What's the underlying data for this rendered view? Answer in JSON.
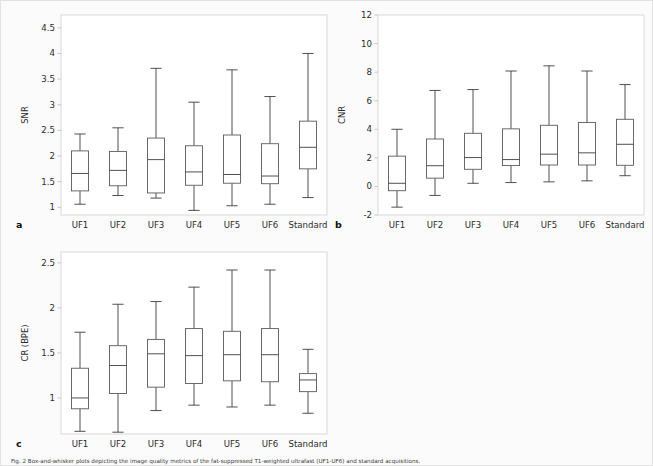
{
  "figure": {
    "background": "#fbfbfb",
    "caption": "Fig. 2  Box-and-whisker plots depicting the image quality metrics of the fat-suppressed T1-weighted ultrafast (UF1-UF6) and standard acquisitions."
  },
  "chart_data": [
    {
      "type": "box",
      "panel_letter": "a",
      "title": "",
      "xlabel": "",
      "ylabel": "SNR",
      "categories": [
        "UF1",
        "UF2",
        "UF3",
        "UF4",
        "UF5",
        "UF6",
        "Standard"
      ],
      "yticks": [
        1,
        1.5,
        2,
        2.5,
        3,
        3.5,
        4,
        4.5
      ],
      "ytick_labels": [
        "1",
        "1.5",
        "2",
        "2.5",
        "3",
        "3.5",
        "4",
        "4.5"
      ],
      "ylim": [
        0.85,
        4.75
      ],
      "grid": false,
      "legend": "none",
      "boxes": [
        {
          "category": "UF1",
          "min": 1.06,
          "q1": 1.32,
          "median": 1.66,
          "q3": 2.1,
          "max": 2.43
        },
        {
          "category": "UF2",
          "min": 1.23,
          "q1": 1.42,
          "median": 1.72,
          "q3": 2.09,
          "max": 2.55
        },
        {
          "category": "UF3",
          "min": 1.18,
          "q1": 1.28,
          "median": 1.93,
          "q3": 2.35,
          "max": 3.71
        },
        {
          "category": "UF4",
          "min": 0.94,
          "q1": 1.43,
          "median": 1.69,
          "q3": 2.2,
          "max": 3.05
        },
        {
          "category": "UF5",
          "min": 1.03,
          "q1": 1.47,
          "median": 1.64,
          "q3": 2.41,
          "max": 3.68
        },
        {
          "category": "UF6",
          "min": 1.06,
          "q1": 1.46,
          "median": 1.61,
          "q3": 2.24,
          "max": 3.16
        },
        {
          "category": "Standard",
          "min": 1.19,
          "q1": 1.75,
          "median": 2.17,
          "q3": 2.68,
          "max": 4.0
        }
      ]
    },
    {
      "type": "box",
      "panel_letter": "b",
      "title": "",
      "xlabel": "",
      "ylabel": "CNR",
      "categories": [
        "UF1",
        "UF2",
        "UF3",
        "UF4",
        "UF5",
        "UF6",
        "Standard"
      ],
      "yticks": [
        -2,
        0,
        2,
        4,
        6,
        8,
        10,
        12
      ],
      "ytick_labels": [
        "-2",
        "0",
        "2",
        "4",
        "6",
        "8",
        "10",
        "12"
      ],
      "ylim": [
        -2,
        12
      ],
      "grid": false,
      "legend": "none",
      "boxes": [
        {
          "category": "UF1",
          "min": -1.45,
          "q1": -0.3,
          "median": 0.22,
          "q3": 2.12,
          "max": 4.0
        },
        {
          "category": "UF2",
          "min": -0.63,
          "q1": 0.58,
          "median": 1.45,
          "q3": 3.32,
          "max": 6.72
        },
        {
          "category": "UF3",
          "min": 0.22,
          "q1": 1.2,
          "median": 2.02,
          "q3": 3.72,
          "max": 6.78
        },
        {
          "category": "UF4",
          "min": 0.27,
          "q1": 1.46,
          "median": 1.88,
          "q3": 4.03,
          "max": 8.08
        },
        {
          "category": "UF5",
          "min": 0.32,
          "q1": 1.5,
          "median": 2.26,
          "q3": 4.28,
          "max": 8.44
        },
        {
          "category": "UF6",
          "min": 0.39,
          "q1": 1.5,
          "median": 2.35,
          "q3": 4.48,
          "max": 8.08
        },
        {
          "category": "Standard",
          "min": 0.75,
          "q1": 1.48,
          "median": 2.95,
          "q3": 4.7,
          "max": 7.13
        }
      ]
    },
    {
      "type": "box",
      "panel_letter": "c",
      "title": "",
      "xlabel": "",
      "ylabel": "CR (BPE)",
      "categories": [
        "UF1",
        "UF2",
        "UF3",
        "UF4",
        "UF5",
        "UF6",
        "Standard"
      ],
      "yticks": [
        1,
        1.5,
        2,
        2.5
      ],
      "ytick_labels": [
        "1",
        "1.5",
        "2",
        "2.5"
      ],
      "ylim": [
        0.6,
        2.62
      ],
      "grid": false,
      "legend": "none",
      "boxes": [
        {
          "category": "UF1",
          "min": 0.63,
          "q1": 0.88,
          "median": 1.0,
          "q3": 1.33,
          "max": 1.73
        },
        {
          "category": "UF2",
          "min": 0.62,
          "q1": 1.05,
          "median": 1.36,
          "q3": 1.58,
          "max": 2.04
        },
        {
          "category": "UF3",
          "min": 0.86,
          "q1": 1.12,
          "median": 1.49,
          "q3": 1.65,
          "max": 2.07
        },
        {
          "category": "UF4",
          "min": 0.92,
          "q1": 1.16,
          "median": 1.47,
          "q3": 1.77,
          "max": 2.23
        },
        {
          "category": "UF5",
          "min": 0.9,
          "q1": 1.19,
          "median": 1.48,
          "q3": 1.74,
          "max": 2.42
        },
        {
          "category": "UF6",
          "min": 0.92,
          "q1": 1.18,
          "median": 1.48,
          "q3": 1.77,
          "max": 2.42
        },
        {
          "category": "Standard",
          "min": 0.83,
          "q1": 1.07,
          "median": 1.2,
          "q3": 1.27,
          "max": 1.54
        }
      ]
    }
  ]
}
